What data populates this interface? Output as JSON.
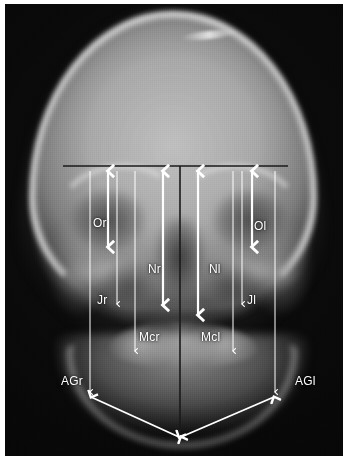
{
  "image": {
    "kind": "radiograph",
    "view": "posteroanterior-skull",
    "background_color": "#0a0a0a",
    "annotation_color": "#ffffff",
    "reference_line_color": "#1a1a1a",
    "width": 348,
    "height": 462
  },
  "annotations": {
    "labels": [
      {
        "id": "Or",
        "text": "Or",
        "x": 88,
        "y": 213,
        "meaning": "orbital-right"
      },
      {
        "id": "Ol",
        "text": "Ol",
        "x": 249,
        "y": 216,
        "meaning": "orbital-left"
      },
      {
        "id": "Nr",
        "text": "Nr",
        "x": 143,
        "y": 259,
        "meaning": "nasal-right"
      },
      {
        "id": "Nl",
        "text": "Nl",
        "x": 204,
        "y": 259,
        "meaning": "nasal-left"
      },
      {
        "id": "Jr",
        "text": "Jr",
        "x": 92,
        "y": 290,
        "meaning": "jugal-right"
      },
      {
        "id": "Jl",
        "text": "Jl",
        "x": 242,
        "y": 290,
        "meaning": "jugal-left"
      },
      {
        "id": "Mcr",
        "text": "Mcr",
        "x": 134,
        "y": 327,
        "meaning": "maxillary-crest-right"
      },
      {
        "id": "Mcl",
        "text": "Mcl",
        "x": 196,
        "y": 327,
        "meaning": "maxillary-crest-left"
      },
      {
        "id": "AGr",
        "text": "AGr",
        "x": 56,
        "y": 371,
        "meaning": "antegonion-right"
      },
      {
        "id": "AGl",
        "text": "AGl",
        "x": 290,
        "y": 371,
        "meaning": "antegonion-left"
      }
    ],
    "reference_lines": [
      {
        "id": "horizontal-baseline",
        "x1": 58,
        "y1": 162,
        "x2": 283,
        "y2": 162,
        "style": "dark"
      },
      {
        "id": "midsagittal-line",
        "x1": 175,
        "y1": 162,
        "x2": 175,
        "y2": 437,
        "style": "dark"
      }
    ],
    "measurement_arrows": [
      {
        "id": "Or",
        "x": 103,
        "y1": 167,
        "y2": 243,
        "weight": "bold",
        "heads": "both"
      },
      {
        "id": "Ol",
        "x": 247,
        "y1": 167,
        "y2": 243,
        "weight": "bold",
        "heads": "both"
      },
      {
        "id": "Nr",
        "x": 158,
        "y1": 167,
        "y2": 301,
        "weight": "bold",
        "heads": "both"
      },
      {
        "id": "Nl",
        "x": 193,
        "y1": 167,
        "y2": 311,
        "weight": "bold",
        "heads": "both"
      },
      {
        "id": "Jr",
        "x": 112,
        "y1": 167,
        "y2": 300,
        "weight": "thin",
        "heads": "down"
      },
      {
        "id": "Jl",
        "x": 237,
        "y1": 167,
        "y2": 300,
        "weight": "thin",
        "heads": "down"
      },
      {
        "id": "Mcr",
        "x": 130,
        "y1": 167,
        "y2": 347,
        "weight": "thin",
        "heads": "down"
      },
      {
        "id": "Mcl",
        "x": 228,
        "y1": 167,
        "y2": 347,
        "weight": "thin",
        "heads": "down"
      },
      {
        "id": "AGr",
        "x": 85,
        "y1": 167,
        "y2": 388,
        "weight": "thin",
        "heads": "down"
      },
      {
        "id": "AGl",
        "x": 270,
        "y1": 167,
        "y2": 388,
        "weight": "thin",
        "heads": "down"
      }
    ],
    "diagonal_arrows": [
      {
        "id": "AGr-menton",
        "x1": 86,
        "y1": 393,
        "x2": 174,
        "y2": 433,
        "heads": "both"
      },
      {
        "id": "AGl-menton",
        "x1": 269,
        "y1": 393,
        "x2": 176,
        "y2": 433,
        "heads": "both"
      }
    ]
  }
}
